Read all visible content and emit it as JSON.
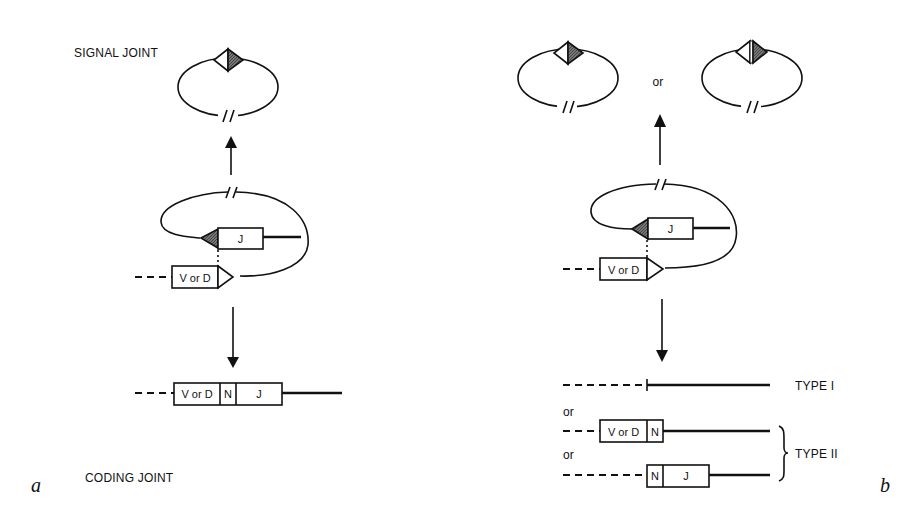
{
  "figure": {
    "panel_a": {
      "panel_label": "a",
      "signal_joint_label": "SIGNAL JOINT",
      "coding_joint_label": "CODING JOINT",
      "intermediate": {
        "j_segment": "J",
        "vd_segment": "V or D"
      },
      "coding_product": {
        "vd_segment": "V or D",
        "n_segment": "N",
        "j_segment": "J"
      }
    },
    "panel_b": {
      "panel_label": "b",
      "or_between_circles": "or",
      "intermediate": {
        "j_segment": "J",
        "vd_segment": "V or D"
      },
      "products": {
        "type1_label": "TYPE I",
        "or_1": "or",
        "or_2": "or",
        "type2_label": "TYPE II",
        "type2a": {
          "vd_segment": "V or D",
          "n_segment": "N"
        },
        "type2b": {
          "n_segment": "N",
          "j_segment": "J"
        }
      }
    },
    "colors": {
      "ink": "#111111",
      "shade": "#555555",
      "background": "#ffffff"
    }
  }
}
